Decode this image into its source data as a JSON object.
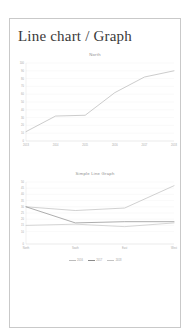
{
  "page": {
    "title": "Line chart / Graph"
  },
  "chart_data": [
    {
      "type": "line",
      "title": "North",
      "xlabel": "",
      "ylabel": "",
      "grid": true,
      "legend": "none",
      "categories": [
        "2013",
        "2014",
        "2015",
        "2016",
        "2017",
        "2018"
      ],
      "ylim": [
        0,
        100
      ],
      "yticks": [
        0,
        10,
        20,
        30,
        40,
        50,
        60,
        70,
        80,
        90,
        100
      ],
      "series": [
        {
          "name": "North",
          "color": "#b6b6b6",
          "values": [
            12,
            32,
            33,
            62,
            82,
            90
          ]
        }
      ]
    },
    {
      "type": "line",
      "title": "Simple Line Graph",
      "xlabel": "",
      "ylabel": "",
      "grid": true,
      "legend": "bottom",
      "categories": [
        "North",
        "South",
        "East",
        "West"
      ],
      "ylim": [
        0,
        50
      ],
      "yticks": [
        0,
        10,
        15,
        20,
        25,
        30,
        35,
        40,
        45,
        50
      ],
      "series": [
        {
          "name": "2016",
          "color": "#bdbdbd",
          "values": [
            30,
            27,
            29,
            47
          ]
        },
        {
          "name": "2017",
          "color": "#8a8a8a",
          "values": [
            30,
            17,
            18,
            18
          ]
        },
        {
          "name": "2018",
          "color": "#c4c4c4",
          "values": [
            15,
            16,
            14,
            17
          ]
        }
      ]
    }
  ]
}
